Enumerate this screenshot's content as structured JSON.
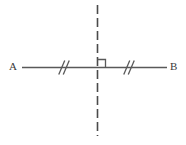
{
  "figure": {
    "kind": "geometry-diagram",
    "width": 186,
    "height": 145,
    "background_color": "#ffffff",
    "stroke_color": "#595959",
    "dash_color": "#4a4a4a",
    "labels": {
      "left_endpoint": "A",
      "right_endpoint": "B"
    },
    "segment": {
      "name": "segment-ab",
      "x1": 22,
      "y1": 67.5,
      "x2": 167,
      "y2": 67.5,
      "stroke_width": 1.6,
      "style": "solid"
    },
    "bisector": {
      "name": "perpendicular-bisector",
      "x": 97.5,
      "y1": 5,
      "y2": 136,
      "stroke_width": 1.6,
      "style": "dashed",
      "dash_length": 9,
      "gap_length": 4
    },
    "right_angle": {
      "name": "right-angle-marker",
      "size": 8,
      "corner_x": 97.5,
      "corner_y": 67.5,
      "direction": "up-right",
      "stroke_width": 1.3
    },
    "tick_marks": [
      {
        "name": "congruence-ticks-left",
        "center_x": 64,
        "center_y": 67.5,
        "count": 2,
        "spacing": 4.5,
        "half_height": 7,
        "slant": 3,
        "stroke_width": 1.3
      },
      {
        "name": "congruence-ticks-right",
        "center_x": 129,
        "center_y": 67.5,
        "count": 2,
        "spacing": 4.5,
        "half_height": 7,
        "slant": 3,
        "stroke_width": 1.3
      }
    ]
  }
}
